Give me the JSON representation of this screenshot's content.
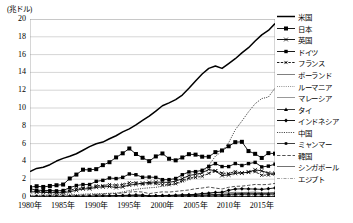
{
  "chart_data": {
    "type": "line",
    "title": "",
    "unit_label": "(兆ドル)",
    "xlabel": "",
    "ylabel": "",
    "ylim": [
      0,
      20
    ],
    "ytick_values": [
      0,
      2,
      4,
      6,
      8,
      10,
      12,
      14,
      16,
      18,
      20
    ],
    "ytick_labels": [
      "0",
      "2",
      "4",
      "6",
      "8",
      "10",
      "12",
      "14",
      "16",
      "18",
      "20"
    ],
    "xlim": [
      1980,
      2017
    ],
    "xtick_values": [
      1980,
      1985,
      1990,
      1995,
      2000,
      2005,
      2010,
      2015
    ],
    "xtick_labels": [
      "1980年",
      "1985年",
      "1990年",
      "1995年",
      "2000年",
      "2005年",
      "2010年",
      "2015年"
    ],
    "grid": "horizontal",
    "legend_position": "right",
    "x": [
      1980,
      1981,
      1982,
      1983,
      1984,
      1985,
      1986,
      1987,
      1988,
      1989,
      1990,
      1991,
      1992,
      1993,
      1994,
      1995,
      1996,
      1997,
      1998,
      1999,
      2000,
      2001,
      2002,
      2003,
      2004,
      2005,
      2006,
      2007,
      2008,
      2009,
      2010,
      2011,
      2012,
      2013,
      2014,
      2015,
      2016,
      2017
    ],
    "series": [
      {
        "name": "米国",
        "style": "solid-thick",
        "marker": "none",
        "color": "#000000",
        "values": [
          2.86,
          3.21,
          3.34,
          3.63,
          4.04,
          4.34,
          4.58,
          4.86,
          5.25,
          5.66,
          5.98,
          6.17,
          6.54,
          6.88,
          7.31,
          7.66,
          8.1,
          8.61,
          9.09,
          9.66,
          10.25,
          10.58,
          10.94,
          11.46,
          12.21,
          13.04,
          13.82,
          14.45,
          14.71,
          14.45,
          14.99,
          15.54,
          16.2,
          16.78,
          17.52,
          18.22,
          18.71,
          19.49
        ]
      },
      {
        "name": "日本",
        "style": "solid",
        "marker": "square",
        "color": "#000000",
        "values": [
          1.1,
          1.21,
          1.13,
          1.24,
          1.32,
          1.4,
          2.08,
          2.52,
          3.07,
          3.05,
          3.13,
          3.58,
          3.91,
          4.45,
          4.91,
          5.45,
          4.83,
          4.41,
          4.03,
          4.56,
          4.89,
          4.3,
          4.12,
          4.44,
          4.81,
          4.76,
          4.53,
          4.52,
          5.04,
          5.23,
          5.7,
          6.16,
          6.2,
          5.16,
          4.85,
          4.39,
          4.93,
          4.87
        ]
      },
      {
        "name": "英国",
        "style": "solid",
        "marker": "x",
        "color": "#000000",
        "values": [
          0.6,
          0.55,
          0.52,
          0.5,
          0.47,
          0.49,
          0.6,
          0.75,
          0.91,
          0.93,
          1.09,
          1.14,
          1.18,
          1.06,
          1.14,
          1.34,
          1.42,
          1.56,
          1.65,
          1.68,
          1.66,
          1.64,
          1.79,
          2.05,
          2.42,
          2.54,
          2.71,
          3.1,
          2.93,
          2.41,
          2.48,
          2.66,
          2.7,
          2.79,
          3.06,
          2.93,
          2.69,
          2.66
        ]
      },
      {
        "name": "ドイツ",
        "style": "solid",
        "marker": "square-sm",
        "color": "#000000",
        "values": [
          0.95,
          0.76,
          0.74,
          0.73,
          0.69,
          0.73,
          1.05,
          1.29,
          1.4,
          1.4,
          1.76,
          1.87,
          2.13,
          2.07,
          2.21,
          2.59,
          2.5,
          2.22,
          2.24,
          2.2,
          1.95,
          1.95,
          2.08,
          2.5,
          2.82,
          2.85,
          3.0,
          3.44,
          3.75,
          3.42,
          3.42,
          3.76,
          3.54,
          3.75,
          3.89,
          3.38,
          3.47,
          3.69
        ]
      },
      {
        "name": "フランス",
        "style": "dashed",
        "marker": "x-sm",
        "color": "#000000",
        "values": [
          0.7,
          0.61,
          0.58,
          0.56,
          0.53,
          0.56,
          0.77,
          0.93,
          1.02,
          1.03,
          1.27,
          1.27,
          1.4,
          1.33,
          1.4,
          1.61,
          1.61,
          1.44,
          1.5,
          1.49,
          1.37,
          1.38,
          1.49,
          1.84,
          2.12,
          2.2,
          2.32,
          2.66,
          2.93,
          2.69,
          2.64,
          2.86,
          2.68,
          2.81,
          2.85,
          2.44,
          2.47,
          2.58
        ]
      },
      {
        "name": "ポーランド",
        "style": "solid-thin",
        "marker": "none",
        "color": "#555555",
        "values": [
          0.06,
          0.06,
          0.05,
          0.06,
          0.06,
          0.07,
          0.07,
          0.07,
          0.07,
          0.08,
          0.06,
          0.08,
          0.09,
          0.09,
          0.11,
          0.14,
          0.16,
          0.16,
          0.17,
          0.17,
          0.17,
          0.19,
          0.2,
          0.22,
          0.26,
          0.31,
          0.34,
          0.43,
          0.53,
          0.44,
          0.48,
          0.53,
          0.5,
          0.52,
          0.55,
          0.48,
          0.47,
          0.52
        ]
      },
      {
        "name": "ルーマニア",
        "style": "dotted",
        "marker": "none",
        "color": "#666666",
        "values": [
          0.04,
          0.04,
          0.04,
          0.04,
          0.04,
          0.04,
          0.05,
          0.05,
          0.05,
          0.05,
          0.04,
          0.03,
          0.02,
          0.03,
          0.03,
          0.04,
          0.04,
          0.04,
          0.04,
          0.04,
          0.04,
          0.04,
          0.05,
          0.06,
          0.08,
          0.1,
          0.12,
          0.17,
          0.21,
          0.17,
          0.17,
          0.19,
          0.17,
          0.19,
          0.2,
          0.18,
          0.19,
          0.21
        ]
      },
      {
        "name": "マレーシア",
        "style": "solid-thin",
        "marker": "none",
        "color": "#777777",
        "values": [
          0.03,
          0.03,
          0.03,
          0.03,
          0.03,
          0.03,
          0.03,
          0.03,
          0.04,
          0.04,
          0.04,
          0.05,
          0.06,
          0.07,
          0.07,
          0.09,
          0.1,
          0.1,
          0.07,
          0.08,
          0.09,
          0.09,
          0.1,
          0.11,
          0.12,
          0.14,
          0.16,
          0.19,
          0.23,
          0.2,
          0.25,
          0.3,
          0.31,
          0.32,
          0.34,
          0.3,
          0.3,
          0.31
        ]
      },
      {
        "name": "タイ",
        "style": "solid-thin",
        "marker": "triangle",
        "color": "#000000",
        "values": [
          0.03,
          0.03,
          0.04,
          0.04,
          0.04,
          0.04,
          0.04,
          0.05,
          0.06,
          0.07,
          0.09,
          0.1,
          0.11,
          0.13,
          0.14,
          0.17,
          0.18,
          0.15,
          0.11,
          0.13,
          0.13,
          0.12,
          0.13,
          0.15,
          0.17,
          0.19,
          0.22,
          0.26,
          0.29,
          0.28,
          0.34,
          0.37,
          0.4,
          0.42,
          0.41,
          0.4,
          0.41,
          0.45
        ]
      },
      {
        "name": "インドネシア",
        "style": "solid",
        "marker": "diamond",
        "color": "#000000",
        "values": [
          0.07,
          0.09,
          0.09,
          0.09,
          0.09,
          0.09,
          0.08,
          0.08,
          0.09,
          0.1,
          0.11,
          0.13,
          0.14,
          0.16,
          0.18,
          0.2,
          0.23,
          0.22,
          0.1,
          0.14,
          0.17,
          0.16,
          0.2,
          0.24,
          0.26,
          0.29,
          0.39,
          0.43,
          0.51,
          0.54,
          0.75,
          0.89,
          0.92,
          0.91,
          0.89,
          0.86,
          0.93,
          1.02
        ]
      },
      {
        "name": "中国",
        "style": "dotted-fine",
        "marker": "none",
        "color": "#222222",
        "values": [
          0.19,
          0.2,
          0.2,
          0.23,
          0.26,
          0.31,
          0.3,
          0.27,
          0.31,
          0.35,
          0.36,
          0.38,
          0.42,
          0.44,
          0.56,
          0.73,
          0.86,
          0.96,
          1.03,
          1.09,
          1.21,
          1.34,
          1.47,
          1.66,
          1.96,
          2.29,
          2.75,
          3.55,
          4.59,
          5.11,
          6.09,
          7.55,
          8.53,
          9.57,
          10.48,
          11.06,
          11.23,
          12.24
        ]
      },
      {
        "name": "ミャンマー",
        "style": "solid-thin",
        "marker": "square-tiny",
        "color": "#000000",
        "values": [
          0.01,
          0.01,
          0.01,
          0.01,
          0.01,
          0.01,
          0.01,
          0.01,
          0.01,
          0.01,
          0.01,
          0.01,
          0.01,
          0.01,
          0.01,
          0.01,
          0.01,
          0.01,
          0.01,
          0.01,
          0.01,
          0.01,
          0.01,
          0.01,
          0.01,
          0.01,
          0.01,
          0.02,
          0.02,
          0.03,
          0.04,
          0.06,
          0.06,
          0.06,
          0.07,
          0.06,
          0.06,
          0.07
        ]
      },
      {
        "name": "韓国",
        "style": "dashed-long",
        "marker": "none",
        "color": "#333333",
        "values": [
          0.06,
          0.07,
          0.08,
          0.09,
          0.1,
          0.1,
          0.12,
          0.15,
          0.2,
          0.24,
          0.28,
          0.33,
          0.36,
          0.39,
          0.46,
          0.56,
          0.6,
          0.56,
          0.38,
          0.49,
          0.58,
          0.55,
          0.63,
          0.71,
          0.79,
          0.93,
          1.01,
          1.12,
          1.0,
          0.9,
          1.09,
          1.2,
          1.22,
          1.31,
          1.41,
          1.38,
          1.41,
          1.53
        ]
      },
      {
        "name": "シンガポール",
        "style": "solid-thin",
        "marker": "none",
        "color": "#444444",
        "values": [
          0.01,
          0.01,
          0.02,
          0.02,
          0.02,
          0.02,
          0.02,
          0.02,
          0.03,
          0.03,
          0.04,
          0.05,
          0.05,
          0.06,
          0.07,
          0.08,
          0.1,
          0.1,
          0.09,
          0.09,
          0.1,
          0.09,
          0.09,
          0.1,
          0.11,
          0.13,
          0.15,
          0.18,
          0.19,
          0.19,
          0.24,
          0.28,
          0.29,
          0.3,
          0.31,
          0.3,
          0.31,
          0.34
        ]
      },
      {
        "name": "エジプト",
        "style": "dash-dot",
        "marker": "none",
        "color": "#888888",
        "values": [
          0.02,
          0.02,
          0.03,
          0.03,
          0.03,
          0.04,
          0.04,
          0.05,
          0.05,
          0.06,
          0.06,
          0.05,
          0.05,
          0.05,
          0.05,
          0.06,
          0.07,
          0.08,
          0.09,
          0.09,
          0.1,
          0.1,
          0.09,
          0.08,
          0.08,
          0.09,
          0.11,
          0.13,
          0.16,
          0.19,
          0.22,
          0.24,
          0.28,
          0.29,
          0.31,
          0.33,
          0.33,
          0.24
        ]
      }
    ]
  }
}
